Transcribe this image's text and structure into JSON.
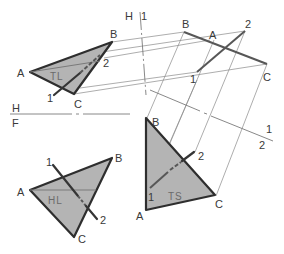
{
  "figure": {
    "colors": {
      "plane_fill": "#b4b4b4",
      "outline": "#2e2e2e",
      "construction": "#8a8a8a"
    }
  },
  "fold_lines": {
    "h_f": {
      "upper": "H",
      "lower": "F"
    },
    "h_1": {
      "left": "H",
      "right": "1"
    },
    "one_two": {
      "upper": "1",
      "lower": "2"
    }
  },
  "views": {
    "top": {
      "vertices": {
        "a": "A",
        "b": "B",
        "c": "C"
      },
      "line_ends": {
        "p1": "1",
        "p2": "2"
      },
      "inner_label": "TL"
    },
    "edge": {
      "vertices": {
        "a": "A",
        "b": "B",
        "c": "C"
      },
      "line_ends": {
        "p1": "1",
        "p2": "2"
      }
    },
    "front": {
      "vertices": {
        "a": "A",
        "b": "B",
        "c": "C"
      },
      "line_ends": {
        "p1": "1",
        "p2": "2"
      },
      "inner_label": "HL"
    },
    "true_size": {
      "vertices": {
        "a": "A",
        "b": "B",
        "c": "C"
      },
      "line_ends": {
        "p1": "1",
        "p2": "2"
      },
      "inner_label": "TS"
    }
  }
}
